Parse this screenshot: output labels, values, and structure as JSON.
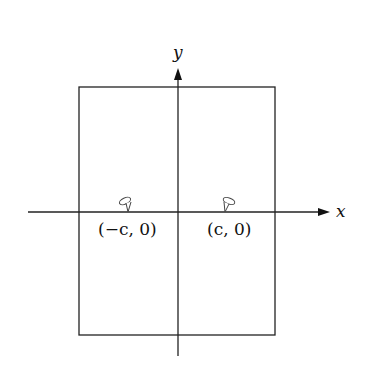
{
  "diagram": {
    "type": "coordinate-plane-with-rectangle",
    "axes": {
      "x_label": "x",
      "y_label": "y"
    },
    "rectangle": {
      "left": 79,
      "top": 87,
      "right": 275,
      "bottom": 335
    },
    "points": [
      {
        "label": "(−c, 0)",
        "marker": "thumbtack-icon"
      },
      {
        "label": "(c, 0)",
        "marker": "thumbtack-icon"
      }
    ],
    "colors": {
      "stroke": "#222222",
      "background": "#ffffff"
    }
  }
}
